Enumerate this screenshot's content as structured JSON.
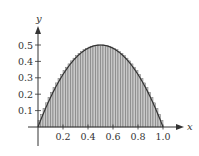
{
  "chart_data": {
    "type": "area",
    "title": "",
    "xlabel": "x",
    "ylabel": "y",
    "function": "y = 2x(1 - x)",
    "xlim": [
      0,
      1.0
    ],
    "ylim": [
      0,
      0.5
    ],
    "x_ticks": [
      "0.2",
      "0.4",
      "0.6",
      "0.8",
      "1.0"
    ],
    "x_tick_values": [
      0.2,
      0.4,
      0.6,
      0.8,
      1.0
    ],
    "y_ticks": [
      "0.1",
      "0.2",
      "0.3",
      "0.4",
      "0.5"
    ],
    "y_tick_values": [
      0.1,
      0.2,
      0.3,
      0.4,
      0.5
    ],
    "rectangles": {
      "count": 50,
      "type": "upper sum",
      "fill": "#bdbdbd",
      "stroke": "#555555"
    },
    "grid": false,
    "legend": null,
    "colors": {
      "curve": "#333333",
      "axis": "#333333",
      "fill": "#c8c8c8"
    }
  }
}
